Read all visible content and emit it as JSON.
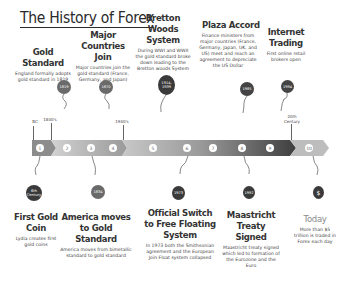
{
  "title": "The History of Forex",
  "colors": {
    "bar_dark": "#555555",
    "bar_mid": "#8a8a8a",
    "bar_light": "#c8c8c8",
    "badge_dark": "#3a3a3a",
    "badge_mid": "#6a6a6a",
    "today_text": "#8a8a8a"
  },
  "timeline": {
    "ticks": [
      {
        "label": "BC"
      },
      {
        "label": "1800's"
      },
      {
        "label": "1900's"
      },
      {
        "label": "20th Century"
      }
    ],
    "nodes": [
      "1",
      "2",
      "3",
      "4",
      "5",
      "6",
      "7",
      "8",
      "9",
      "10"
    ]
  },
  "events_top": [
    {
      "id": "gold-standard",
      "title": "Gold Standard",
      "desc": "England formally adopts gold standard in 1819",
      "badge": "1819"
    },
    {
      "id": "major-countries",
      "title": "Major Countries Join",
      "desc": "Major countries join the gold standard (France, Germany, and Japan)",
      "badge": "1870"
    },
    {
      "id": "bretton-woods",
      "title": "Bretton Woods System",
      "desc": "During WWI and WWII the gold standard broke down leading to the Bretton woods System",
      "badge": "1914, 1939"
    },
    {
      "id": "plaza-accord",
      "title": "Plaza Accord",
      "desc": "Finance ministers from major countries (France, Germany, Japan, UK, and US) meet and reach an agreement to depreciate the US Dollar",
      "badge": "1985"
    },
    {
      "id": "internet-trading",
      "title": "Internet Trading",
      "desc": "First online retail brokers open",
      "badge": "1994"
    }
  ],
  "events_bottom": [
    {
      "id": "first-gold-coin",
      "title": "First Gold Coin",
      "desc": "Lydia creates first gold coins",
      "badge": "6th Century"
    },
    {
      "id": "america-gold",
      "title": "America moves to Gold Standard",
      "desc": "America moves from bimetallic standard to gold standard",
      "badge": "1834"
    },
    {
      "id": "free-floating",
      "title": "Official Switch to Free Floating System",
      "desc": "In 1973 both the Smithsonian agreement and the European Join Float system collapsed",
      "badge": "1973"
    },
    {
      "id": "maastricht",
      "title": "Maastricht Treaty Signed",
      "desc": "Maastricht treaty signed which led to formation of the Eurozone and the Euro",
      "badge": "1992"
    },
    {
      "id": "today",
      "title": "Today",
      "desc": "More than $5 trillion is traded in Forex each day",
      "badge": "$"
    }
  ]
}
